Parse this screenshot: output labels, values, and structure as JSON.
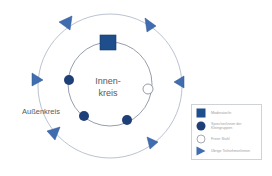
{
  "diagram": {
    "colors": {
      "circle_line": "#a9b3c6",
      "square_fill": "#1f4e8c",
      "dot_fill": "#1f3f78",
      "free_fill": "#ffffff",
      "triangle_fill": "#3f6db0",
      "label_text": "#555a60"
    },
    "inner_circle": {
      "label_line1": "Innen-",
      "label_line2": "kreis"
    },
    "outer_circle": {
      "label": "Außenkreis"
    },
    "inner_elements": [
      {
        "type": "square",
        "role": "moderator",
        "x": 108,
        "y": 43
      },
      {
        "type": "dot",
        "role": "speaker",
        "x": 69,
        "y": 80
      },
      {
        "type": "dot",
        "role": "speaker",
        "x": 84,
        "y": 116
      },
      {
        "type": "dot",
        "role": "speaker",
        "x": 127,
        "y": 120
      },
      {
        "type": "free",
        "role": "free-chair",
        "x": 148,
        "y": 89
      }
    ],
    "outer_elements": [
      {
        "type": "triangle",
        "role": "participant",
        "x": 65,
        "y": 22
      },
      {
        "type": "triangle",
        "role": "participant",
        "x": 150,
        "y": 24
      },
      {
        "type": "triangle",
        "role": "participant",
        "x": 36,
        "y": 80
      },
      {
        "type": "triangle",
        "role": "participant",
        "x": 180,
        "y": 82
      },
      {
        "type": "triangle",
        "role": "participant",
        "x": 53,
        "y": 133
      },
      {
        "type": "triangle",
        "role": "participant",
        "x": 151,
        "y": 143
      }
    ]
  },
  "legend": {
    "items": [
      {
        "symbol": "square-icon",
        "label": "Moderator/in"
      },
      {
        "symbol": "dot-icon",
        "label": "Sprecher/innen der Kleingruppen"
      },
      {
        "symbol": "empty-circle-icon",
        "label": "Freier Stuhl"
      },
      {
        "symbol": "triangle-icon",
        "label": "Übrige Teilnehmer/innen"
      }
    ]
  }
}
